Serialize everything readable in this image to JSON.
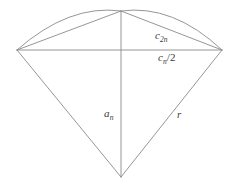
{
  "figure": {
    "stroke_color": "#8a8a8a",
    "label_color": "#3c3c3c",
    "background_color": "#ffffff",
    "stroke_width": 0.9,
    "labels": {
      "chord_2n": {
        "base": "c",
        "sub": "2n",
        "suffix": ""
      },
      "half_chord_n": {
        "base": "c",
        "sub": "n",
        "suffix": "/2"
      },
      "apothem_n": {
        "base": "a",
        "sub": "n",
        "suffix": ""
      },
      "radius": {
        "base": "r",
        "sub": "",
        "suffix": ""
      }
    },
    "geometry": {
      "center": {
        "x": 121,
        "y": 177
      },
      "apex": {
        "x": 121,
        "y": 11
      },
      "left_vertex": {
        "x": 17,
        "y": 50
      },
      "right_vertex": {
        "x": 222,
        "y": 50
      },
      "radius": 166,
      "arc_path": "M 17 50 Q 69 4 121 11 Q 173 4 222 50",
      "segments": [
        {
          "name": "radius-left",
          "x1": 121,
          "y1": 177,
          "x2": 17,
          "y2": 50
        },
        {
          "name": "radius-right",
          "x1": 121,
          "y1": 177,
          "x2": 222,
          "y2": 50
        },
        {
          "name": "apothem",
          "x1": 121,
          "y1": 177,
          "x2": 121,
          "y2": 11
        },
        {
          "name": "chord-full",
          "x1": 17,
          "y1": 50,
          "x2": 222,
          "y2": 50
        },
        {
          "name": "chord-left-half",
          "x1": 17,
          "y1": 50,
          "x2": 121,
          "y2": 11
        },
        {
          "name": "chord-right-half",
          "x1": 121,
          "y1": 11,
          "x2": 222,
          "y2": 50
        }
      ]
    }
  }
}
